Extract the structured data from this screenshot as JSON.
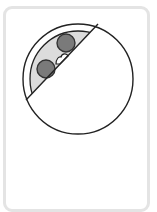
{
  "card": {
    "border_color": "#e4e4e4",
    "background": "#ffffff"
  },
  "figure": {
    "outer_circle": {
      "cx": 78,
      "cy": 79,
      "r": 55,
      "stroke": "#222222",
      "fill": "#ffffff"
    },
    "inner_arc": {
      "cx": 78,
      "cy": 79,
      "r": 48,
      "fill": "#dcdcdc"
    },
    "chord": {
      "x1": 98,
      "y1": 24,
      "x2": 26,
      "y2": 100,
      "stroke": "#222222"
    },
    "dots": [
      {
        "cx": 66,
        "cy": 43,
        "r": 9,
        "fill": "#7a7a7a",
        "stroke": "#333333"
      },
      {
        "cx": 46,
        "cy": 69,
        "r": 9,
        "fill": "#7a7a7a",
        "stroke": "#333333"
      }
    ],
    "bump": {
      "fill": "#ffffff",
      "stroke": "#222222"
    }
  }
}
